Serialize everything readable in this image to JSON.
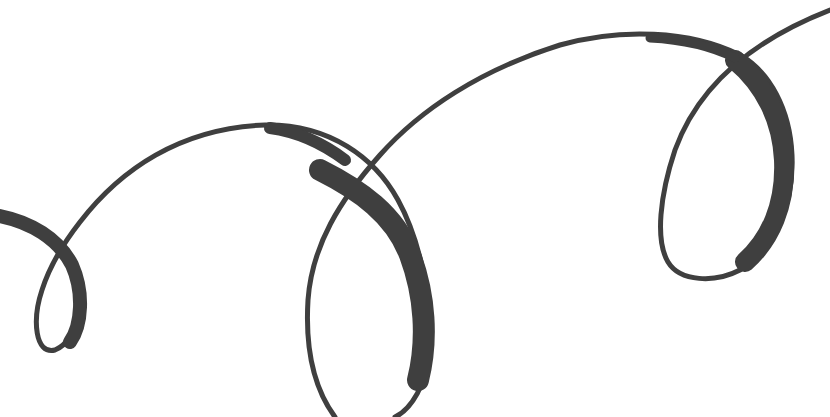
{
  "image": {
    "description": "Calligraphic ribbon swirl with three loops",
    "background": "#ffffff",
    "stroke_color": "#3f3f3f",
    "loops": 3
  }
}
